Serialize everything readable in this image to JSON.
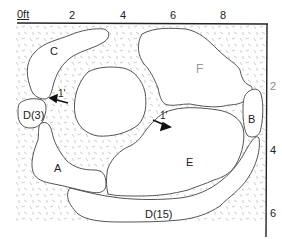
{
  "diagram": {
    "type": "plan-map",
    "colors": {
      "outline": "#555555",
      "axis": "#222222",
      "hatch": "#b5b5b5",
      "label": "#222222",
      "label_light": "#9a9a9a"
    },
    "scale": {
      "top_axis": {
        "unit_label": "0ft",
        "ticks": [
          "2",
          "4",
          "6",
          "8"
        ]
      },
      "right_axis": {
        "ticks": [
          "2",
          "4",
          "6"
        ]
      }
    },
    "regions": [
      {
        "id": "A",
        "label": "A"
      },
      {
        "id": "B",
        "label": "B"
      },
      {
        "id": "C",
        "label": "C"
      },
      {
        "id": "D3",
        "label": "D(3)"
      },
      {
        "id": "D15",
        "label": "D(15)"
      },
      {
        "id": "E",
        "label": "E"
      },
      {
        "id": "F",
        "label": "F"
      }
    ],
    "annotations": [
      {
        "label": "1'",
        "arrow": "pointing left toward D(3)/C gap"
      },
      {
        "label": "1'",
        "arrow": "pointing right toward E"
      }
    ]
  }
}
